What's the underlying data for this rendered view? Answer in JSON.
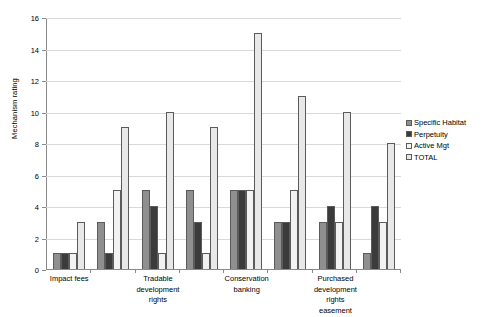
{
  "chart_data": {
    "type": "bar",
    "title": "",
    "xlabel": "",
    "ylabel": "Mechanism rating",
    "ylim": [
      0,
      16
    ],
    "yticks": [
      0,
      2,
      4,
      6,
      8,
      10,
      12,
      14,
      16
    ],
    "grid": true,
    "legend_position": "right",
    "categories": [
      "Impact fees",
      "",
      "Tradable development rights",
      "",
      "Conservation banking",
      "",
      "Purchased development rights easement",
      ""
    ],
    "category_labels": [
      {
        "lines": [
          "Impact fees"
        ]
      },
      {
        "lines": [
          ""
        ]
      },
      {
        "lines": [
          "Tradable",
          "development",
          "rights"
        ]
      },
      {
        "lines": [
          ""
        ]
      },
      {
        "lines": [
          "Conservation",
          "banking"
        ]
      },
      {
        "lines": [
          ""
        ]
      },
      {
        "lines": [
          "Purchased",
          "development",
          "rights easement"
        ]
      },
      {
        "lines": [
          ""
        ]
      }
    ],
    "series": [
      {
        "name": "Specific Habitat",
        "color": "#8f8f8f",
        "values": [
          1,
          3,
          5,
          5,
          5,
          3,
          3,
          1
        ]
      },
      {
        "name": "Perpetuity",
        "color": "#3b3b3b",
        "values": [
          1,
          1,
          4,
          3,
          5,
          3,
          4,
          4
        ]
      },
      {
        "name": "Active Mgt",
        "color": "#f2f2f2",
        "values": [
          1,
          5,
          1,
          1,
          5,
          5,
          3,
          3
        ]
      },
      {
        "name": "TOTAL",
        "color": "#e8e8e8",
        "values": [
          3,
          9,
          10,
          9,
          15,
          11,
          10,
          8
        ]
      }
    ]
  }
}
